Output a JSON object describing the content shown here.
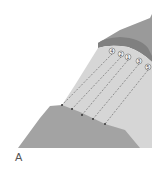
{
  "panel_label": "A",
  "markers": [
    {
      "label": "4",
      "x": 112,
      "y": 51
    },
    {
      "label": "2",
      "x": 121,
      "y": 54
    },
    {
      "label": "1",
      "x": 128,
      "y": 57
    },
    {
      "label": "3",
      "x": 139,
      "y": 61
    },
    {
      "label": "5",
      "x": 148,
      "y": 67
    }
  ],
  "colors": {
    "upper_slope": "#9a9a9a",
    "cap_band": "#808080",
    "light_face": "#d4d4d4",
    "lower_slope": "#a3a3a3",
    "dashed_line": "#707070",
    "endpoint": "#2a2a2a"
  }
}
